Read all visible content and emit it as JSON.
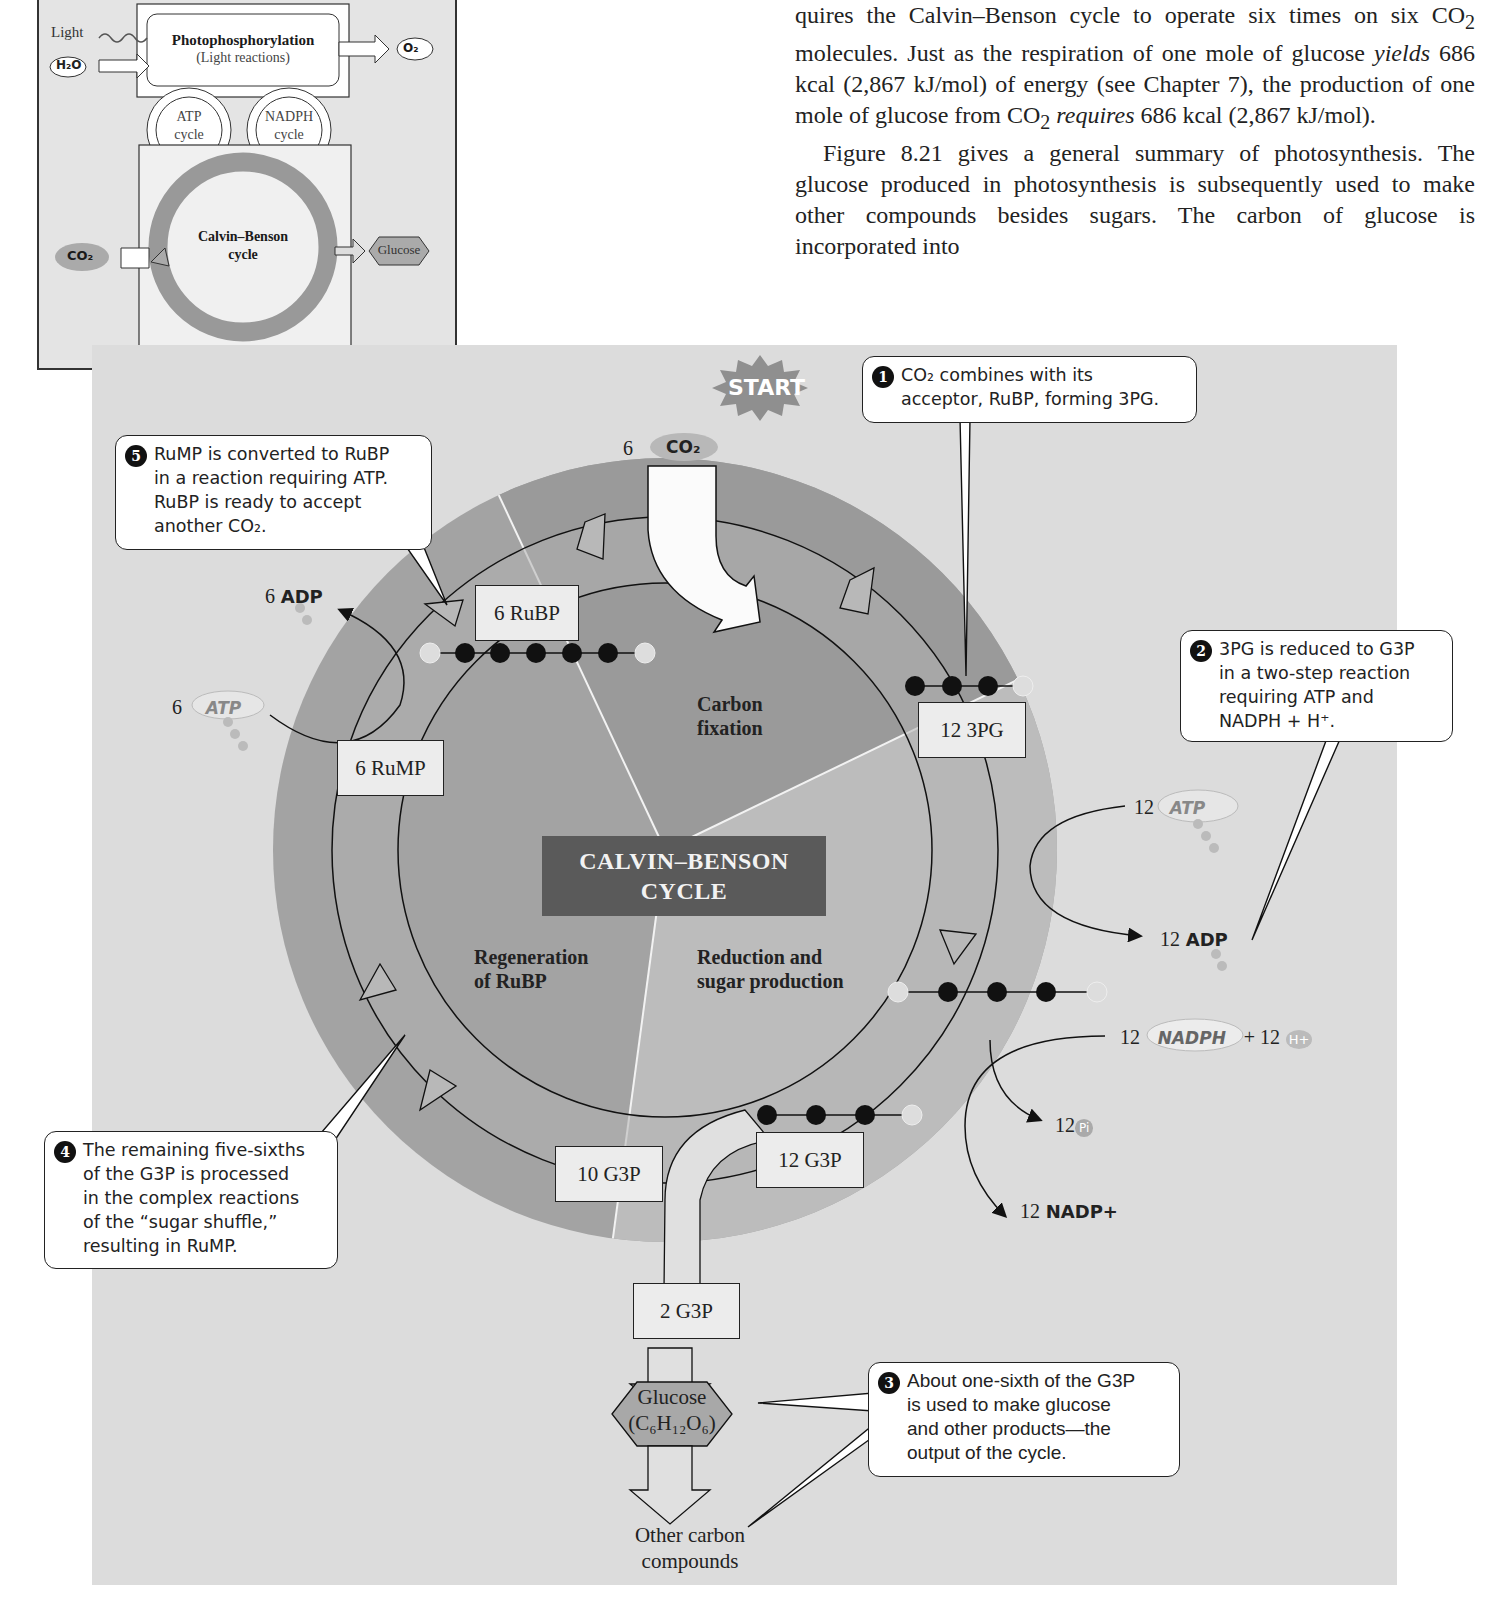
{
  "inset": {
    "light_label": "Light",
    "h2o_label": "H₂O",
    "photo_title": "Photophosphorylation",
    "photo_sub": "(Light reactions)",
    "o2_label": "O₂",
    "atp_cycle": [
      "ATP",
      "cycle"
    ],
    "nadph_cycle": [
      "NADPH",
      "cycle"
    ],
    "calvin_title": [
      "Calvin–Benson",
      "cycle"
    ],
    "co2_label": "CO₂",
    "glucose_label": "Glucose"
  },
  "body_text": {
    "para1": "quires the Calvin–Benson cycle to operate six times on six CO₂ molecules. Just as the respiration of one mole of glucose yields 686 kcal (2,867 kJ/mol) of energy (see Chapter 7), the production of one mole of glucose from CO₂ requires 686 kcal (2,867 kJ/mol).",
    "para1_parts": {
      "a": "quires the Calvin–Benson cycle to operate six times on six CO",
      "b": " molecules. Just as the respiration of one mole of glucose ",
      "yields": "yields",
      "c": " 686 kcal (2,867 kJ/mol) of energy (see Chapter 7), the production of one mole of glucose from CO",
      "requires": "requires",
      "d": " 686 kcal (2,867 kJ/mol).",
      "sub2": "2"
    },
    "para2": "Figure 8.21 gives a general summary of photosynthesis. The glucose produced in photosynthesis is subsequently used to make other compounds besides sugars. The carbon of glucose is incorporated into"
  },
  "diagram": {
    "start_label": "START",
    "center_title": [
      "CALVIN–BENSON",
      "CYCLE"
    ],
    "sectors": {
      "carbon_fixation": [
        "Carbon",
        "fixation"
      ],
      "reduction": [
        "Reduction and",
        "sugar production"
      ],
      "regeneration": [
        "Regeneration",
        "of RuBP"
      ]
    },
    "co2_input": {
      "count": "6",
      "label": "CO₂"
    },
    "boxes": {
      "rubp": "6 RuBP",
      "pg3": "12 3PG",
      "rump": "6 RuMP",
      "g3p12": "12 G3P",
      "g3p10": "10 G3P",
      "g3p2": "2 G3P"
    },
    "molecules": {
      "adp6": {
        "count": "6",
        "label": "ADP"
      },
      "atp6": {
        "count": "6",
        "label": "ATP"
      },
      "atp12": {
        "count": "12",
        "label": "ATP"
      },
      "adp12": {
        "count": "12",
        "label": "ADP"
      },
      "nadph12": {
        "count": "12",
        "label": "NADPH",
        "plus": "+ 12",
        "h": "H+"
      },
      "pi12": {
        "count": "12",
        "label": "Pi"
      },
      "nadp12": {
        "count": "12",
        "label": "NADP+"
      }
    },
    "glucose": {
      "name": "Glucose",
      "formula": "(C₆H₁₂O₆)"
    },
    "other_carbon": [
      "Other carbon",
      "compounds"
    ],
    "carbon_chains": {
      "rubp_chain": "P-C-C-C-C-C-P",
      "pg3_chain": "C-C-C-P",
      "bpg_chain": "P-C-C-C-P",
      "g3p_chain": "C-C-C-P"
    },
    "callouts": [
      {
        "num": "1",
        "lines": [
          "CO₂ combines with its",
          "acceptor, RuBP, forming 3PG."
        ]
      },
      {
        "num": "2",
        "lines": [
          "3PG is reduced to G3P",
          "in a two-step reaction",
          "requiring ATP and",
          "NADPH + H⁺."
        ]
      },
      {
        "num": "3",
        "lines": [
          "About one-sixth of the G3P",
          "is used to make glucose",
          "and other products—the",
          "output of the cycle."
        ]
      },
      {
        "num": "4",
        "lines": [
          "The remaining five-sixths",
          "of the G3P is processed",
          "in the complex reactions",
          "of the “sugar shuffle,”",
          "resulting in RuMP."
        ]
      },
      {
        "num": "5",
        "lines": [
          "RuMP is converted to RuBP",
          "in a reaction requiring ATP.",
          "RuBP is ready to accept",
          "another CO₂."
        ]
      }
    ]
  },
  "colors": {
    "panel_bg": "#dcdcdc",
    "disc_outer": "#a9a9a9",
    "sector_dark": "#9a9a9a",
    "sector_mid": "#a6a6a6",
    "sector_light": "#bdbdbd",
    "ring_band": "#b4b4b4",
    "title_box": "#5a5a5a",
    "box_fill": "#ececec"
  }
}
